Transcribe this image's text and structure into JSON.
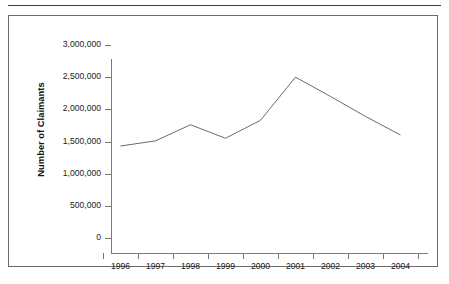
{
  "page": {
    "background_color": "#ffffff",
    "rule_color": "#3c3c3c",
    "frame_color": "#6b6b6b"
  },
  "chart_data": {
    "type": "line",
    "title": "",
    "subtitle": "",
    "xlabel": "",
    "ylabel": "Number of Claimants",
    "categories": [
      "1996",
      "1997",
      "1998",
      "1999",
      "2000",
      "2001",
      "2002",
      "2003",
      "2004"
    ],
    "values": [
      1430000,
      1510000,
      1760000,
      1550000,
      1830000,
      2500000,
      2200000,
      1890000,
      1600000
    ],
    "series": [
      {
        "name": "Number of Claimants",
        "values": [
          1430000,
          1510000,
          1760000,
          1550000,
          1830000,
          2500000,
          2200000,
          1890000,
          1600000
        ],
        "color": "#5a5a5a"
      }
    ],
    "ylim": [
      0,
      3000000
    ],
    "ytick_values": [
      0,
      500000,
      1000000,
      1500000,
      2000000,
      2500000,
      3000000
    ],
    "ytick_labels": [
      "0",
      "500,000",
      "1,000,000",
      "1,500,000",
      "2,000,000",
      "2,500,000",
      "3,000,000"
    ],
    "grid": false,
    "legend": false,
    "legend_position": "none",
    "line_color": "#5a5a5a",
    "axis_color": "#7a7a7a",
    "markers": false
  }
}
